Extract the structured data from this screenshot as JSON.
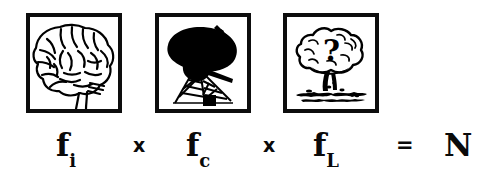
{
  "figure": {
    "name": "drake-equation-fragment",
    "background_color": "#ffffff",
    "ink_color": "#000000"
  },
  "panels": [
    {
      "id": "brain",
      "icon": "brain-icon",
      "caption": "Human brain in left profile with brain stem",
      "alt": "brain"
    },
    {
      "id": "dish",
      "icon": "radio-telescope-icon",
      "caption": "Radio telescope dish on lattice tripod",
      "alt": "radio telescope"
    },
    {
      "id": "mushroom",
      "icon": "mushroom-cloud-icon",
      "caption": "Nuclear mushroom cloud with question mark",
      "alt": "mushroom cloud with question mark"
    }
  ],
  "formula": {
    "terms": [
      {
        "base": "f",
        "sub": "i",
        "name": "term-fi"
      },
      {
        "base": "f",
        "sub": "c",
        "name": "term-fc"
      },
      {
        "base": "f",
        "sub": "L",
        "name": "term-fL"
      }
    ],
    "multiply_1": "x",
    "multiply_2": "x",
    "equals": "=",
    "result": "N",
    "plain_text": "fi x fc x fL = N"
  }
}
